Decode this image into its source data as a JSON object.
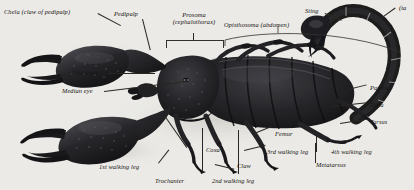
{
  "figure": {
    "background_color": "#f4f3f0",
    "body_color": "#17161a",
    "leader_color": "#2a2623"
  },
  "labels": {
    "chela": "Chela (claw of pedipalp)",
    "pedipalp": "Pedipalp",
    "prosoma_line1": "Prosoma",
    "prosoma_line2": "(cephalothorax)",
    "opisthosoma": "Opisthosoma (abdomen)",
    "sting": "Sting",
    "tail": "(ta",
    "chelicera": "Chelicera",
    "median_eye": "Median eye",
    "patella": "Patella",
    "tibia": "Tibia",
    "tarsus": "Tarsus",
    "coxa": "Coxa",
    "trochanter": "Trochanter",
    "femur": "Femur",
    "claw": "Claw",
    "metatarsus": "Metatarsus",
    "leg1": "1st walking leg",
    "leg2": "2nd walking leg",
    "leg3": "3rd walking leg",
    "leg4": "4th walking leg"
  }
}
